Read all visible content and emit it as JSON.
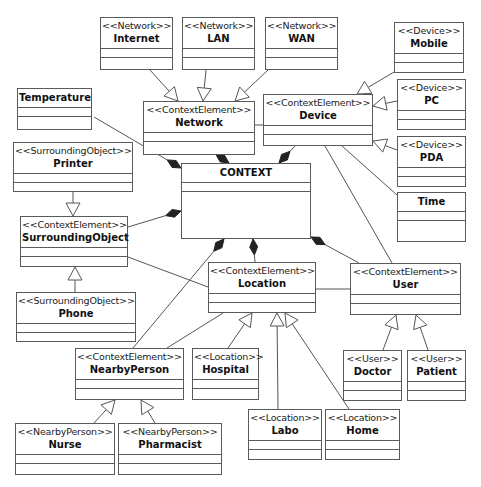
{
  "diagram": {
    "title": "CONTEXT",
    "classes": [
      {
        "id": "internet",
        "stereotype": "<<Network>>",
        "name": "Internet",
        "x": 100,
        "y": 17,
        "w": 73,
        "h": 53
      },
      {
        "id": "lan",
        "stereotype": "<<Network>>",
        "name": "LAN",
        "x": 182,
        "y": 17,
        "w": 73,
        "h": 53
      },
      {
        "id": "wan",
        "stereotype": "<<Network>>",
        "name": "WAN",
        "x": 265,
        "y": 17,
        "w": 73,
        "h": 53
      },
      {
        "id": "mobile",
        "stereotype": "<<Device>>",
        "name": "Mobile",
        "x": 394,
        "y": 22,
        "w": 70,
        "h": 51
      },
      {
        "id": "temperature",
        "stereotype": "",
        "name": "Temperature",
        "x": 17,
        "y": 88,
        "w": 75,
        "h": 42
      },
      {
        "id": "network",
        "stereotype": "<<ContextElement>>",
        "name": "Network",
        "x": 143,
        "y": 101,
        "w": 112,
        "h": 54
      },
      {
        "id": "device",
        "stereotype": "<<ContextElement>>",
        "name": "Device",
        "x": 263,
        "y": 94,
        "w": 110,
        "h": 52
      },
      {
        "id": "pc",
        "stereotype": "<<Device>>",
        "name": "PC",
        "x": 397,
        "y": 79,
        "w": 69,
        "h": 51
      },
      {
        "id": "pda",
        "stereotype": "<<Device>>",
        "name": "PDA",
        "x": 397,
        "y": 136,
        "w": 69,
        "h": 51
      },
      {
        "id": "time",
        "stereotype": "",
        "name": "Time",
        "x": 397,
        "y": 192,
        "w": 69,
        "h": 50
      },
      {
        "id": "printer",
        "stereotype": "<<SurroundingObject>>",
        "name": "Printer",
        "x": 13,
        "y": 142,
        "w": 120,
        "h": 50
      },
      {
        "id": "context",
        "stereotype": "",
        "name": "CONTEXT",
        "x": 181,
        "y": 163,
        "w": 130,
        "h": 76
      },
      {
        "id": "surroundingobject",
        "stereotype": "<<ContextElement>>",
        "name": "SurroundingObject",
        "x": 20,
        "y": 216,
        "w": 108,
        "h": 51
      },
      {
        "id": "location",
        "stereotype": "<<ContextElement>>",
        "name": "Location",
        "x": 208,
        "y": 262,
        "w": 108,
        "h": 51
      },
      {
        "id": "user",
        "stereotype": "<<ContextElement>>",
        "name": "User",
        "x": 350,
        "y": 263,
        "w": 111,
        "h": 52
      },
      {
        "id": "phone",
        "stereotype": "<<SurroundingObject>>",
        "name": "Phone",
        "x": 16,
        "y": 292,
        "w": 120,
        "h": 50
      },
      {
        "id": "nearbyperson",
        "stereotype": "<<ContextElement>>",
        "name": "NearbyPerson",
        "x": 75,
        "y": 348,
        "w": 109,
        "h": 52
      },
      {
        "id": "hospital",
        "stereotype": "<<Location>>",
        "name": "Hospital",
        "x": 192,
        "y": 348,
        "w": 67,
        "h": 52
      },
      {
        "id": "doctor",
        "stereotype": "<<User>>",
        "name": "Doctor",
        "x": 343,
        "y": 350,
        "w": 59,
        "h": 51
      },
      {
        "id": "patient",
        "stereotype": "<<User>>",
        "name": "Patient",
        "x": 407,
        "y": 350,
        "w": 59,
        "h": 51
      },
      {
        "id": "labo",
        "stereotype": "<<Location>>",
        "name": "Labo",
        "x": 248,
        "y": 409,
        "w": 74,
        "h": 51
      },
      {
        "id": "home",
        "stereotype": "<<Location>>",
        "name": "Home",
        "x": 325,
        "y": 409,
        "w": 75,
        "h": 51
      },
      {
        "id": "nurse",
        "stereotype": "<<NearbyPerson>>",
        "name": "Nurse",
        "x": 15,
        "y": 423,
        "w": 100,
        "h": 52
      },
      {
        "id": "pharmacist",
        "stereotype": "<<NearbyPerson>>",
        "name": "Pharmacist",
        "x": 118,
        "y": 423,
        "w": 104,
        "h": 52
      }
    ],
    "relations": [
      {
        "type": "generalization",
        "from": "internet",
        "to": "network",
        "x1": 150,
        "y1": 70,
        "x2": 178,
        "y2": 101
      },
      {
        "type": "generalization",
        "from": "lan",
        "to": "network",
        "x1": 206,
        "y1": 70,
        "x2": 203,
        "y2": 101
      },
      {
        "type": "generalization",
        "from": "wan",
        "to": "network",
        "x1": 268,
        "y1": 70,
        "x2": 235,
        "y2": 101
      },
      {
        "type": "generalization",
        "from": "mobile",
        "to": "device",
        "x1": 394,
        "y1": 72,
        "x2": 357,
        "y2": 94
      },
      {
        "type": "generalization",
        "from": "pc",
        "to": "device",
        "x1": 397,
        "y1": 101,
        "x2": 373,
        "y2": 106
      },
      {
        "type": "generalization",
        "from": "pda",
        "to": "device",
        "x1": 397,
        "y1": 150,
        "x2": 373,
        "y2": 141
      },
      {
        "type": "generalization",
        "from": "printer",
        "to": "surroundingobject",
        "x1": 73,
        "y1": 192,
        "x2": 73,
        "y2": 216
      },
      {
        "type": "generalization",
        "from": "phone",
        "to": "surroundingobject",
        "x1": 75,
        "y1": 292,
        "x2": 75,
        "y2": 267
      },
      {
        "type": "generalization",
        "from": "hospital",
        "to": "location",
        "x1": 228,
        "y1": 348,
        "x2": 252,
        "y2": 313
      },
      {
        "type": "generalization",
        "from": "labo",
        "to": "location",
        "x1": 278,
        "y1": 409,
        "x2": 277,
        "y2": 313
      },
      {
        "type": "generalization",
        "from": "home",
        "to": "location",
        "x1": 349,
        "y1": 409,
        "x2": 285,
        "y2": 313
      },
      {
        "type": "generalization",
        "from": "doctor",
        "to": "user",
        "x1": 383,
        "y1": 350,
        "x2": 396,
        "y2": 315
      },
      {
        "type": "generalization",
        "from": "patient",
        "to": "user",
        "x1": 428,
        "y1": 350,
        "x2": 416,
        "y2": 315
      },
      {
        "type": "generalization",
        "from": "nurse",
        "to": "nearbyperson",
        "x1": 94,
        "y1": 423,
        "x2": 115,
        "y2": 400
      },
      {
        "type": "generalization",
        "from": "pharmacist",
        "to": "nearbyperson",
        "x1": 155,
        "y1": 423,
        "x2": 141,
        "y2": 400
      },
      {
        "type": "composition",
        "from": "temperature",
        "to": "context",
        "x1": 94,
        "y1": 117,
        "x2": 181,
        "y2": 168
      },
      {
        "type": "composition",
        "from": "network",
        "to": "context",
        "x1": 217,
        "y1": 155,
        "x2": 229,
        "y2": 163
      },
      {
        "type": "composition",
        "from": "device",
        "to": "context",
        "x1": 295,
        "y1": 146,
        "x2": 279,
        "y2": 163
      },
      {
        "type": "composition",
        "from": "surroundingobject",
        "to": "context",
        "x1": 128,
        "y1": 227,
        "x2": 181,
        "y2": 211
      },
      {
        "type": "composition",
        "from": "nearbyperson",
        "to": "context",
        "x1": 133,
        "y1": 348,
        "x2": 224,
        "y2": 239
      },
      {
        "type": "composition",
        "from": "location",
        "to": "context",
        "x1": 255,
        "y1": 262,
        "x2": 253,
        "y2": 239
      },
      {
        "type": "composition",
        "from": "user",
        "to": "context",
        "x1": 359,
        "y1": 263,
        "x2": 311,
        "y2": 237
      },
      {
        "type": "association",
        "from": "network",
        "to": "device",
        "x1": 255,
        "y1": 125,
        "x2": 263,
        "y2": 125
      },
      {
        "type": "association",
        "from": "device",
        "to": "time",
        "x1": 342,
        "y1": 146,
        "x2": 397,
        "y2": 195
      },
      {
        "type": "association",
        "from": "device",
        "to": "user",
        "x1": 325,
        "y1": 146,
        "x2": 392,
        "y2": 263
      },
      {
        "type": "association",
        "from": "surroundingobject",
        "to": "location",
        "x1": 128,
        "y1": 257,
        "x2": 208,
        "y2": 287
      },
      {
        "type": "association",
        "from": "location",
        "to": "user",
        "x1": 316,
        "y1": 289,
        "x2": 350,
        "y2": 289
      },
      {
        "type": "association",
        "from": "location",
        "to": "nearbyperson",
        "x1": 223,
        "y1": 313,
        "x2": 167,
        "y2": 348
      }
    ]
  },
  "colors": {
    "line": "#555555",
    "border": "#5a5a5a",
    "fill": "#ffffff",
    "diamond": "#222222"
  }
}
